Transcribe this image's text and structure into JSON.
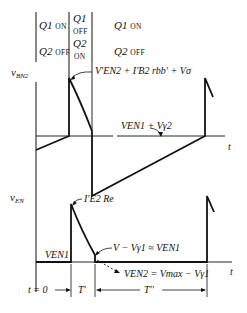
{
  "header": {
    "phase1": {
      "q1": "Q1",
      "q1_state": "ON",
      "q2": "Q2",
      "q2_state": "OFF"
    },
    "phase2": {
      "q1": "Q1",
      "q1_state": "OFF",
      "q2": "Q2",
      "q2_state": "ON"
    },
    "phase3": {
      "q1": "Q1",
      "q1_state": "ON",
      "q2": "Q2",
      "q2_state": "OFF"
    }
  },
  "top_plot": {
    "ylabel": "v",
    "ylabel_sub": "BN2",
    "xlabel": "t",
    "peak_annotation": "V′EN2 + I′B2 rbb′ + Vσ",
    "level_annotation": "VEN1 + Vγ2"
  },
  "bottom_plot": {
    "ylabel": "v",
    "ylabel_sub": "EN",
    "xlabel": "t",
    "peak_annotation": "I′E2 Re",
    "baseline_label": "VEN1",
    "knee_annotation": "V − Vγ1 ≈ VEN1",
    "vEN2_annotation": "VEN2 = Vmax − Vγ1"
  },
  "timing": {
    "t0_label": "t = 0",
    "T1_label": "T′",
    "T2_label": "T′′"
  }
}
